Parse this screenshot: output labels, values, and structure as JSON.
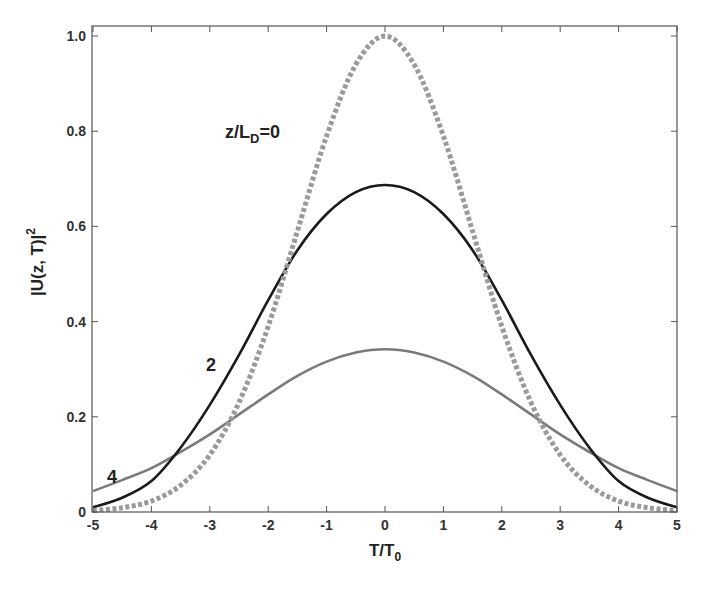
{
  "chart_data": {
    "type": "line",
    "title": "",
    "xlabel": "T/T0",
    "xlabel_main": "T/T",
    "xlabel_sub": "0",
    "ylabel": "|U(z, T)|",
    "ylabel_sup": "2",
    "xlim": [
      -5,
      5
    ],
    "ylim": [
      0,
      1.02
    ],
    "xticks": [
      -5,
      -4,
      -3,
      -2,
      -1,
      0,
      1,
      2,
      3,
      4,
      5
    ],
    "xtick_labels": [
      "-5",
      "-4",
      "-3",
      "-2",
      "-1",
      "0",
      "1",
      "2",
      "3",
      "4",
      "5"
    ],
    "yticks": [
      0,
      0.2,
      0.4,
      0.6,
      0.8,
      1.0
    ],
    "ytick_labels": [
      "0",
      "0.2",
      "0.4",
      "0.6",
      "0.8",
      "1.0"
    ],
    "grid": false,
    "legend": "none (inline annotations)",
    "annotations": [
      {
        "text_main": "z/L",
        "text_sub": "D",
        "text_tail": "=0",
        "x": -2.75,
        "y": 0.8,
        "refers_to": "z/L_D = 0"
      },
      {
        "text": "2",
        "x": -3.0,
        "y": 0.31,
        "refers_to": "z/L_D = 2"
      },
      {
        "text": "4",
        "x": -4.7,
        "y": 0.09,
        "refers_to": "z/L_D = 4"
      }
    ],
    "x": [
      -5,
      -4.5,
      -4,
      -3.5,
      -3,
      -2.5,
      -2,
      -1.5,
      -1,
      -0.5,
      0,
      0.5,
      1,
      1.5,
      2,
      2.5,
      3,
      3.5,
      4,
      4.5,
      5
    ],
    "series": [
      {
        "name": "z/L_D = 0",
        "style": "dashed-thick",
        "color": "#9a9a9a",
        "values": [
          0.003,
          0.009,
          0.023,
          0.056,
          0.12,
          0.23,
          0.39,
          0.59,
          0.79,
          0.94,
          1.0,
          0.94,
          0.79,
          0.59,
          0.39,
          0.23,
          0.12,
          0.056,
          0.023,
          0.009,
          0.003
        ]
      },
      {
        "name": "z/L_D = 2",
        "style": "solid",
        "color": "#1a1a1a",
        "values": [
          0.01,
          0.03,
          0.065,
          0.135,
          0.225,
          0.33,
          0.445,
          0.55,
          0.626,
          0.672,
          0.687,
          0.672,
          0.626,
          0.55,
          0.445,
          0.33,
          0.225,
          0.135,
          0.065,
          0.03,
          0.01
        ]
      },
      {
        "name": "z/L_D = 4",
        "style": "solid",
        "color": "#7a7a7a",
        "values": [
          0.044,
          0.067,
          0.092,
          0.126,
          0.163,
          0.205,
          0.247,
          0.286,
          0.316,
          0.335,
          0.342,
          0.335,
          0.316,
          0.286,
          0.247,
          0.205,
          0.163,
          0.126,
          0.092,
          0.067,
          0.044
        ]
      }
    ]
  }
}
